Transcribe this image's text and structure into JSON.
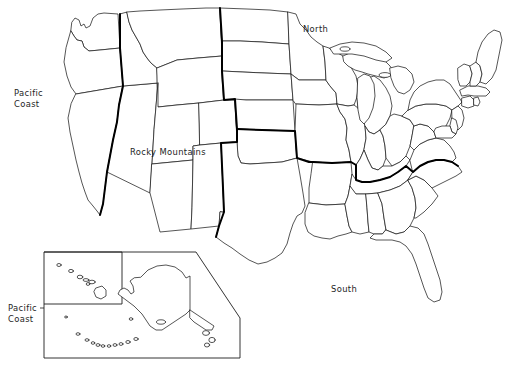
{
  "figure": {
    "kind": "reference-map",
    "background_color": "#ffffff",
    "width": 520,
    "height": 380
  },
  "styles": {
    "state_outline_color": "#1d1d1d",
    "state_fill_color": "#ffffff",
    "region_border_color": "#000000",
    "state_outline_width": 0.75,
    "region_border_width": 2.0,
    "label_color": "#1d1d1d",
    "label_font_size": 8.4
  },
  "labels": [
    {
      "id": "pacific-coast-main",
      "line1": "Pacific",
      "line2": "Coast",
      "x": 14,
      "y": 96,
      "anchor": "start"
    },
    {
      "id": "rocky-mountains",
      "line1": "Rocky Mountains",
      "line2": "",
      "x": 130,
      "y": 155,
      "anchor": "start"
    },
    {
      "id": "north",
      "line1": "North",
      "line2": "",
      "x": 303,
      "y": 32,
      "anchor": "start"
    },
    {
      "id": "south",
      "line1": "South",
      "line2": "",
      "x": 331,
      "y": 292,
      "anchor": "start"
    },
    {
      "id": "pacific-coast-inset",
      "line1": "Pacific",
      "line2": "Coast",
      "x": 8,
      "y": 311,
      "anchor": "start"
    }
  ],
  "regions": [
    {
      "name": "Pacific Coast",
      "label_ref": "pacific-coast-main"
    },
    {
      "name": "Rocky Mountains",
      "label_ref": "rocky-mountains"
    },
    {
      "name": "North",
      "label_ref": "north"
    },
    {
      "name": "South",
      "label_ref": "south"
    },
    {
      "name": "Pacific Coast",
      "label_ref": "pacific-coast-inset"
    }
  ],
  "inset": {
    "name": "alaska-hawaii-inset",
    "outer_box": {
      "x": 44,
      "y": 252,
      "width": 196,
      "height": 106,
      "notched_corner": "bottom-right"
    },
    "hawaii_box": {
      "x": 44,
      "y": 252,
      "width": 78,
      "height": 52
    },
    "contents": [
      "Alaska",
      "Hawaii",
      "Aleutian Islands"
    ],
    "leader_line": {
      "from_x": 40,
      "from_y": 308,
      "to_x": 44,
      "to_y": 308
    }
  },
  "map_content": {
    "projection_note": "Albers-like conic, contiguous 48 states with state boundaries",
    "state_count": 48,
    "great_lakes_rendered": true,
    "inset_states": [
      "Alaska",
      "Hawaii"
    ]
  }
}
